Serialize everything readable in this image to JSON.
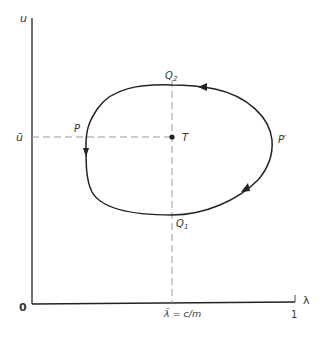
{
  "diagram": {
    "type": "phase-plane-limit-cycle",
    "colors": {
      "axis": "#222222",
      "curve": "#222222",
      "dashed": "#999999",
      "text": "#333333"
    },
    "axes": {
      "y_label": "u",
      "x_label": "λ",
      "origin_label": "0",
      "x_max_label": "1",
      "x_marker_label": "λ̄ = c/m",
      "y_marker_label": "ū"
    },
    "points": {
      "P": "P",
      "P_prime": "P′",
      "Q1": "Q",
      "Q1_sub": "1",
      "Q2": "Q",
      "Q2_sub": "2",
      "T": "T"
    },
    "orbit_direction": "counter-clockwise"
  }
}
